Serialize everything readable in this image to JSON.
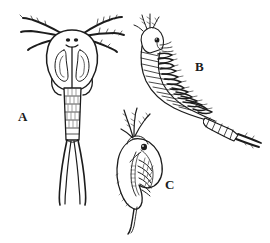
{
  "figure": {
    "background_color": "#ffffff",
    "ink_color": "#1c1c1c",
    "fill_color": "#ffffff",
    "style": "pen-and-ink scientific line drawing",
    "width": 270,
    "height": 243
  },
  "specimens": [
    {
      "id": "a",
      "label": "A",
      "label_x": 18,
      "label_y": 110,
      "common_name": "copepod",
      "orientation": "dorsal view, head up",
      "parts": [
        "antennae",
        "eye-spots",
        "carapace",
        "segmented-abdomen",
        "caudal-rami"
      ]
    },
    {
      "id": "b",
      "label": "B",
      "label_x": 195,
      "label_y": 60,
      "common_name": "fairy shrimp",
      "orientation": "lateral view, head upper-left, curved body",
      "parts": [
        "head",
        "eye",
        "antennae",
        "phyllopod-legs",
        "segmented-abdomen",
        "cercopods"
      ]
    },
    {
      "id": "c",
      "label": "C",
      "label_x": 165,
      "label_y": 178,
      "common_name": "water flea",
      "orientation": "lateral view, head up",
      "parts": [
        "compound-eye",
        "branched-antennae",
        "carapace",
        "thoracic-legs",
        "gut",
        "tail-spine"
      ]
    }
  ]
}
